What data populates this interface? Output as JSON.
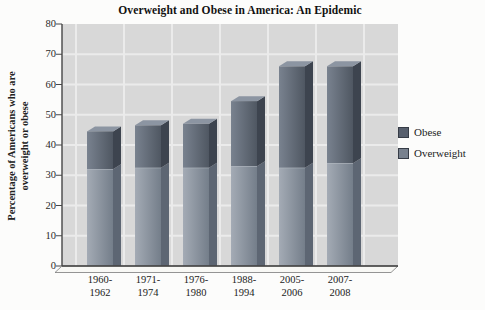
{
  "title": "Overweight and Obese in America: An Epidemic",
  "y_axis": {
    "label_line1": "Percentage of Americans who are",
    "label_line2": "overweight or obese"
  },
  "legend": [
    {
      "label": "Obese",
      "swatch": "#575f6d"
    },
    {
      "label": "Overweight",
      "swatch": "#78818e"
    }
  ],
  "colors": {
    "panel_bg": "#d8d8d8",
    "gridline": "#ebebeb",
    "axis": "#474747",
    "floor_fill": "#f8f8f5",
    "obese_front_light": "#79828f",
    "obese_front_dark": "#4f5762",
    "obese_side": "#3d444f",
    "obese_top": "#8c95a2",
    "overweight_front_light": "#a4abb5",
    "overweight_front_dark": "#747e8a",
    "overweight_side": "#5d6673",
    "split_highlight": "#bcc2cb"
  },
  "chart_data": {
    "type": "bar",
    "stacked": true,
    "style_3d": true,
    "title": "Overweight and Obese in America: An Epidemic",
    "xlabel": "",
    "ylabel": "Percentage of Americans who are overweight or obese",
    "categories": [
      "1960-1962",
      "1971-1974",
      "1976-1980",
      "1988-1994",
      "2005-2006",
      "2007-2008"
    ],
    "stack_order_bottom_to_top": [
      "Overweight",
      "Obese"
    ],
    "series": [
      {
        "name": "Overweight",
        "values": [
          32,
          32.5,
          32.5,
          33,
          32.5,
          34
        ]
      },
      {
        "name": "Obese",
        "values": [
          12.5,
          14,
          14.5,
          21.5,
          33.5,
          32
        ]
      }
    ],
    "totals": [
      44.5,
      46.5,
      47,
      54.5,
      66,
      66
    ],
    "ylim": [
      0,
      80
    ],
    "yticks": [
      0,
      10,
      20,
      30,
      40,
      50,
      60,
      70,
      80
    ],
    "grid": true,
    "legend_position": "right",
    "legend_order": [
      "Obese",
      "Overweight"
    ]
  }
}
